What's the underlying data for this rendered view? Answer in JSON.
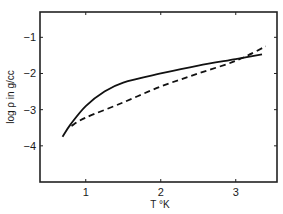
{
  "chart_data": {
    "type": "line",
    "title": "",
    "xlabel": "T °K",
    "ylabel": "log ρ in g/cc",
    "xlim": [
      0.39,
      3.55
    ],
    "ylim": [
      -5.0,
      -0.3
    ],
    "x_ticks": [
      1,
      2,
      3
    ],
    "x_tick_labels": [
      "1",
      "2",
      "3"
    ],
    "y_ticks": [
      -1,
      -2,
      -3,
      -4
    ],
    "y_tick_labels": [
      "−1",
      "−2",
      "−3",
      "−4"
    ],
    "grid": false,
    "legend": null,
    "series": [
      {
        "name": "solid",
        "style": "solid",
        "x": [
          0.69,
          0.8,
          1.0,
          1.25,
          1.5,
          2.0,
          2.5,
          3.0,
          3.35
        ],
        "y": [
          -3.75,
          -3.4,
          -2.9,
          -2.5,
          -2.25,
          -2.0,
          -1.78,
          -1.6,
          -1.47
        ]
      },
      {
        "name": "dashed",
        "style": "dashed",
        "x": [
          0.81,
          1.0,
          1.5,
          2.0,
          2.5,
          3.0,
          3.4
        ],
        "y": [
          -3.45,
          -3.22,
          -2.8,
          -2.36,
          -2.0,
          -1.65,
          -1.25
        ]
      }
    ]
  },
  "colors": {
    "line": "#111111",
    "frame": "#222222"
  }
}
